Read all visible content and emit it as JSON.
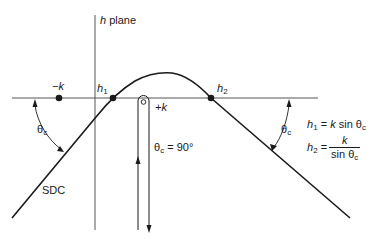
{
  "diagram": {
    "plane_label": {
      "italic": "h",
      "text": " plane"
    },
    "points": {
      "minus_k": "−k",
      "h1": {
        "base": "h",
        "sub": "1"
      },
      "h2": {
        "base": "h",
        "sub": "2"
      },
      "plus_k": "+k"
    },
    "curve_label": "SDC",
    "angle_label": {
      "base": "θ",
      "sub": "c"
    },
    "vertical_contour_label": {
      "base": "θ",
      "sub": "c",
      "rest": " = 90°"
    },
    "equations": {
      "h1": {
        "lhs_base": "h",
        "lhs_sub": "1",
        "rhs": " = ",
        "rhs_k": "k",
        "rhs_tail": " sin θ",
        "rhs_sub": "c"
      },
      "h2": {
        "lhs_base": "h",
        "lhs_sub": "2",
        "eq": " = ",
        "numerator": "k",
        "denominator": "sin θ",
        "denominator_sub": "c"
      }
    },
    "colors": {
      "line": "#1a1a1a",
      "axis": "#555555",
      "background": "#ffffff"
    }
  }
}
